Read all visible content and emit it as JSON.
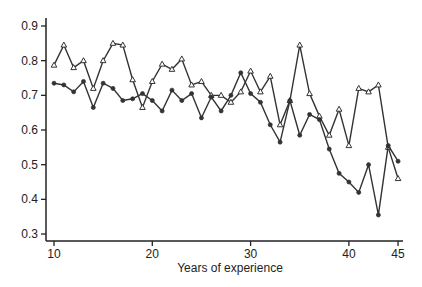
{
  "chart_data": {
    "type": "line",
    "title": "",
    "xlabel": "Years of experience",
    "ylabel": "",
    "xlim": [
      9.7,
      45.5
    ],
    "ylim": [
      0.28,
      0.92
    ],
    "grid": false,
    "legend": null,
    "x_ticks": [
      10,
      20,
      30,
      40,
      45
    ],
    "x_tick_labels": [
      "10",
      "20",
      "30",
      "40",
      "45"
    ],
    "y_ticks": [
      0.3,
      0.4,
      0.5,
      0.6,
      0.7,
      0.8,
      0.9
    ],
    "y_tick_labels": [
      "0.3",
      "0.4",
      "0.5",
      "0.6",
      "0.7",
      "0.8",
      "0.9"
    ],
    "x": [
      10,
      11,
      12,
      13,
      14,
      15,
      16,
      17,
      18,
      19,
      20,
      21,
      22,
      23,
      24,
      25,
      26,
      27,
      28,
      29,
      30,
      31,
      32,
      33,
      34,
      35,
      36,
      37,
      38,
      39,
      40,
      41,
      42,
      43,
      44,
      45
    ],
    "series": [
      {
        "name": "triangle-series",
        "marker": "triangle",
        "values": [
          0.787,
          0.845,
          0.78,
          0.8,
          0.72,
          0.8,
          0.85,
          0.845,
          0.745,
          0.665,
          0.74,
          0.79,
          0.775,
          0.805,
          0.73,
          0.74,
          0.7,
          0.7,
          0.68,
          0.71,
          0.77,
          0.71,
          0.755,
          0.615,
          0.685,
          0.845,
          0.705,
          0.64,
          0.585,
          0.66,
          0.555,
          0.72,
          0.71,
          0.73,
          0.55,
          0.46
        ]
      },
      {
        "name": "circle-series",
        "marker": "circle",
        "values": [
          0.735,
          0.73,
          0.71,
          0.74,
          0.665,
          0.735,
          0.72,
          0.685,
          0.69,
          0.705,
          0.685,
          0.655,
          0.715,
          0.685,
          0.705,
          0.635,
          0.695,
          0.655,
          0.7,
          0.765,
          0.705,
          0.68,
          0.615,
          0.565,
          0.685,
          0.585,
          0.645,
          0.63,
          0.545,
          0.475,
          0.45,
          0.42,
          0.5,
          0.355,
          0.555,
          0.51
        ]
      }
    ]
  },
  "colors": {
    "line": "#333333",
    "axis": "#222222"
  }
}
